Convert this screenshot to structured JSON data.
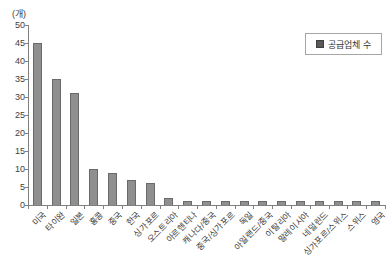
{
  "chart_data": {
    "type": "bar",
    "title": "",
    "unit_label": "(개)",
    "xlabel": "",
    "ylabel": "",
    "categories": [
      "미국",
      "타이완",
      "일본",
      "홍콩",
      "중국",
      "한국",
      "싱가포르",
      "오스트리아",
      "아르헨티나",
      "캐나다/중국",
      "중국/싱가포르",
      "독일",
      "아일랜드/중국",
      "이탈리아",
      "말레이시아",
      "네덜란드",
      "싱가포르/스위스",
      "스위스",
      "영국"
    ],
    "values": [
      45,
      35,
      31,
      10,
      9,
      7,
      6,
      2,
      1,
      1,
      1,
      1,
      1,
      1,
      1,
      1,
      1,
      1,
      1
    ],
    "ylim": [
      0,
      50
    ],
    "ytick_step": 5,
    "legend": [
      "공급업체 수"
    ],
    "legend_position": "top-right",
    "grid": false
  },
  "colors": {
    "bar_fill": "#8f8f8f",
    "bar_border": "#6a6a6a",
    "legend_marker_fill": "#595959",
    "legend_marker_border": "#3f3f3f",
    "axis": "#808080",
    "text": "#404040"
  }
}
